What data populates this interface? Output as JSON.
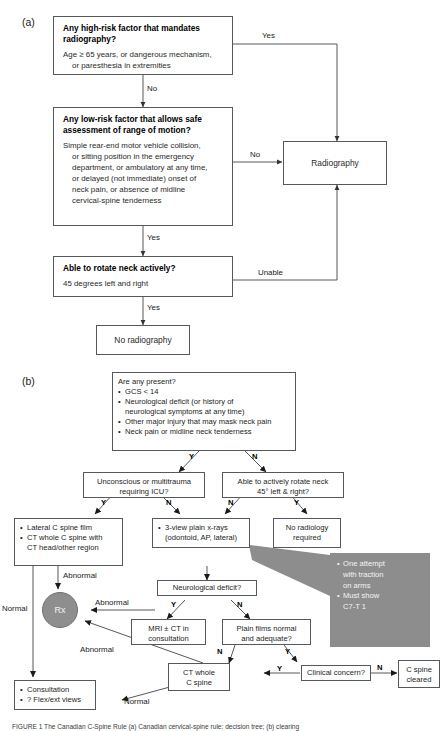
{
  "figure": {
    "panels": [
      {
        "key": "a",
        "label": "(a)"
      },
      {
        "key": "b",
        "label": "(b)"
      }
    ],
    "caption": "FIGURE 1 The Canadian C-Spine Rule (a) Canadian cervical-spine rule: decision tree; (b) clearing"
  },
  "panel_a": {
    "nodes": {
      "high_risk": {
        "title": "Any high-risk factor that mandates radiography?",
        "body_line1": "Age ≥ 65 years, or dangerous mechanism,",
        "body_line2": "or paresthesia in extremities"
      },
      "low_risk": {
        "title": "Any low-risk factor that allows safe assessment of range of motion?",
        "body_line1": "Simple rear-end motor vehicle collision,",
        "body_line2": "or sitting position in the emergency",
        "body_line3": "department, or ambulatory at any time,",
        "body_line4": "or delayed (not immediate) onset of",
        "body_line5": "neck pain, or absence of midline",
        "body_line6": "cervical-spine tenderness"
      },
      "rotate": {
        "title": "Able to rotate neck actively?",
        "body_line1": "45 degrees left and right"
      },
      "radiography": {
        "label": "Radiography"
      },
      "no_radiography": {
        "label": "No radiography"
      }
    },
    "edges": {
      "high_risk_yes": "Yes",
      "high_risk_no": "No",
      "low_risk_no": "No",
      "low_risk_yes": "Yes",
      "rotate_unable": "Unable",
      "rotate_yes": "Yes"
    }
  },
  "panel_b": {
    "nodes": {
      "are_any_present": {
        "title": "Are any present?",
        "items": [
          "GCS < 14",
          "Neurological deficit (or history of neurological symptoms at any time)",
          "Other major injury that may mask neck pain",
          "Neck pain or midline neck tenderness"
        ],
        "item2_line1": "Neurological deficit (or history of",
        "item2_line2": "neurological symptoms at any time)"
      },
      "unconscious": {
        "line1": "Unconscious or multitrauma",
        "line2": "requiring ICU?"
      },
      "rotate45": {
        "line1": "Able to actively rotate neck",
        "line2": "45° left & right?"
      },
      "lateral_ct": {
        "item1": "Lateral C spine film",
        "item2_line1": "CT whole C spine with",
        "item2_line2": "CT head/other region"
      },
      "three_view": {
        "item1_line1": "3-view plain x-rays",
        "item1_line2": "(odontoid, AP, lateral)"
      },
      "no_radiology": {
        "line1": "No radiology",
        "line2": "required"
      },
      "neuro_deficit": {
        "label": "Neurological deficit?"
      },
      "mri_ct": {
        "line1": "MRI ± CT in",
        "line2": "consultation"
      },
      "plain_films": {
        "line1": "Plain films normal",
        "line2": "and adequate?"
      },
      "rx": {
        "label": "Rx"
      },
      "ct_whole": {
        "line1": "CT whole",
        "line2": "C spine"
      },
      "clinical_concern": {
        "label": "Clinical concern?"
      },
      "c_spine_cleared": {
        "line1": "C spine",
        "line2": "cleared"
      },
      "consultation": {
        "item1": "Consultation",
        "item2": "? Flex/ext views"
      },
      "callout": {
        "item1_line1": "One attempt",
        "item1_line2": "with traction",
        "item1_line3": "on arms",
        "item2_line1": "Must show",
        "item2_line2": "C7-T 1"
      }
    },
    "edges": {
      "present_y": "Y",
      "present_n": "N",
      "unconscious_y": "Y",
      "unconscious_n": "N",
      "rotate45_n": "N",
      "rotate45_y": "Y",
      "lateral_abnormal": "Abnormal",
      "lateral_normal": "Normal",
      "neuro_y": "Y",
      "neuro_n": "N",
      "mri_abnormal": "Abnormal",
      "ct_abnormal": "Abnormal",
      "plain_n": "N",
      "plain_y": "Y",
      "ct_normal": "Normal",
      "concern_y": "Y",
      "concern_n": "N",
      "concern_in_y": "Y"
    }
  },
  "colors": {
    "stroke": "#55585c",
    "rx_fill": "#8e8e8e",
    "callout_fill": "#8d8d8d",
    "text": "#1a1a1a"
  }
}
